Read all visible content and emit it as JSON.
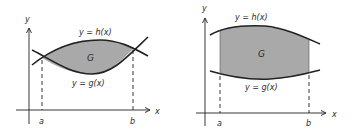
{
  "figures": [
    {
      "name": "intersecting-curves",
      "region_label": "G",
      "upper_curve_label": "y = h(x)",
      "lower_curve_label": "y = g(x)",
      "x_axis_label": "x",
      "y_axis_label": "y",
      "left_bound_label": "a",
      "right_bound_label": "b"
    },
    {
      "name": "separated-curves",
      "region_label": "G",
      "upper_curve_label": "y = h(x)",
      "lower_curve_label": "y = g(x)",
      "x_axis_label": "x",
      "y_axis_label": "y",
      "left_bound_label": "a",
      "right_bound_label": "b"
    }
  ],
  "colors": {
    "line": "#222222",
    "shading": "#a9a9a9",
    "background": "#ffffff"
  }
}
